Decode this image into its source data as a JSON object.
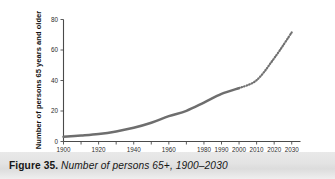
{
  "figure": {
    "caption_label": "Figure 35.",
    "caption_title": "Number of persons 65+, 1900–2030",
    "background_color": "#ffffff",
    "caption_band_color": "#e3e3e3"
  },
  "chart_data": {
    "type": "line",
    "title": "",
    "xlabel": "",
    "ylabel": "Number of persons 65 years and older",
    "xlim": [
      1900,
      2035
    ],
    "ylim": [
      0,
      80
    ],
    "grid": false,
    "legend": "none",
    "y_ticks": [
      0,
      20,
      40,
      60,
      80
    ],
    "y_tick_labels": [
      "0",
      "20",
      "40",
      "60",
      "80"
    ],
    "x_ticks": [
      1900,
      1910,
      1920,
      1930,
      1940,
      1950,
      1960,
      1970,
      1980,
      1990,
      2000,
      2010,
      2020,
      2030
    ],
    "x_tick_labels_shown": [
      "1900",
      "1920",
      "1940",
      "1960",
      "1980",
      "1990",
      "2000",
      "2010",
      "2020",
      "2030"
    ],
    "x_tick_label_years": [
      1900,
      1920,
      1940,
      1960,
      1980,
      1990,
      2000,
      2010,
      2020,
      2030
    ],
    "line_color": "#6e6e6e",
    "series": [
      {
        "name": "Actual (solid)",
        "style": "solid",
        "x": [
          1900,
          1910,
          1920,
          1930,
          1940,
          1950,
          1960,
          1970,
          1980,
          1990,
          2000
        ],
        "values": [
          3.1,
          3.9,
          4.9,
          6.6,
          9.0,
          12.3,
          16.6,
          20.1,
          25.5,
          31.2,
          35.0
        ]
      },
      {
        "name": "Projected (dotted)",
        "style": "dotted",
        "x": [
          2000,
          2010,
          2020,
          2030
        ],
        "values": [
          35.0,
          40.2,
          54.6,
          71.5
        ]
      }
    ]
  }
}
